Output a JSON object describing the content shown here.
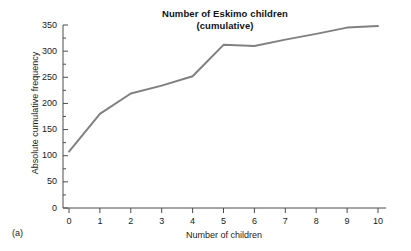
{
  "figure": {
    "panel_label": "(a)",
    "title_line1": "Number of Eskimo children",
    "title_line2": "(cumulative)",
    "line_color": "#808080",
    "axis_color": "#4d4d4d",
    "background": "#ffffff"
  },
  "chart_data": {
    "type": "line",
    "title": "Number of Eskimo children (cumulative)",
    "xlabel": "Number of children",
    "ylabel": "Absolute cumulative frequency",
    "x": [
      0,
      1,
      2,
      3,
      4,
      5,
      6,
      7,
      8,
      9,
      10
    ],
    "values": [
      108,
      180,
      219,
      234,
      252,
      312,
      310,
      322,
      333,
      345,
      348
    ],
    "series": [
      {
        "name": "Absolute cumulative frequency",
        "values": [
          108,
          180,
          219,
          234,
          252,
          312,
          310,
          322,
          333,
          345,
          348
        ]
      }
    ],
    "xlim": [
      0,
      10
    ],
    "ylim": [
      0,
      350
    ],
    "x_ticks": [
      "0",
      "1",
      "2",
      "3",
      "4",
      "5",
      "6",
      "7",
      "8",
      "9",
      "10"
    ],
    "y_ticks": [
      "0",
      "50",
      "100",
      "150",
      "200",
      "250",
      "300",
      "350"
    ],
    "y_minor_ticks": [
      25,
      75,
      125,
      175,
      225,
      275,
      325
    ],
    "grid": false,
    "legend": false,
    "legend_position": "none",
    "markers": false
  }
}
